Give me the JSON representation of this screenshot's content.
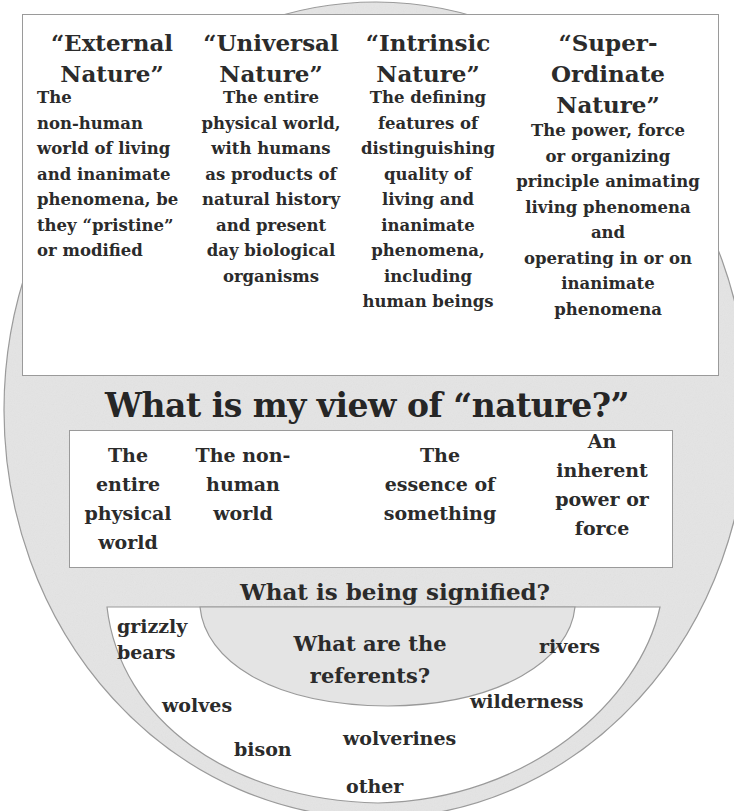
{
  "diagram": {
    "colors": {
      "outer_ellipse_fill": "#e4e4e4",
      "outer_ellipse_stroke": "#9a9a9a",
      "box_fill": "#ffffff",
      "text": "#2b2b2b"
    },
    "conceptions": [
      {
        "title": "“External Nature”",
        "description": "The\nnon-human\nworld of living\nand inanimate\nphenomena, be\nthey “pristine”\nor modified"
      },
      {
        "title": "“Universal Nature”",
        "description": "The entire\nphysical world,\nwith humans\nas products of\nnatural history\nand present\nday biological\norganisms"
      },
      {
        "title": "“Intrinsic Nature”",
        "description": "The defining\nfeatures of\ndistinguishing\nquality of\nliving and\ninanimate\nphenomena,\nincluding\nhuman beings"
      },
      {
        "title": "“Super-Ordinate Nature”",
        "description": "The power, force\nor organizing\nprinciple animating\nliving phenomena\nand\noperating in or on\ninanimate\nphenomena"
      }
    ],
    "main_question": "What is my view of “nature?”",
    "views": [
      "The\nentire\nphysical\nworld",
      "The non-\nhuman\nworld",
      "The\nessence of\nsomething",
      "An\ninherent\npower or\nforce"
    ],
    "signified_question": "What is being signified?",
    "referents_question": "What are the\nreferents?",
    "referents": [
      "grizzly\nbears",
      "rivers",
      "wolves",
      "wilderness",
      "bison",
      "wolverines",
      "other"
    ]
  }
}
